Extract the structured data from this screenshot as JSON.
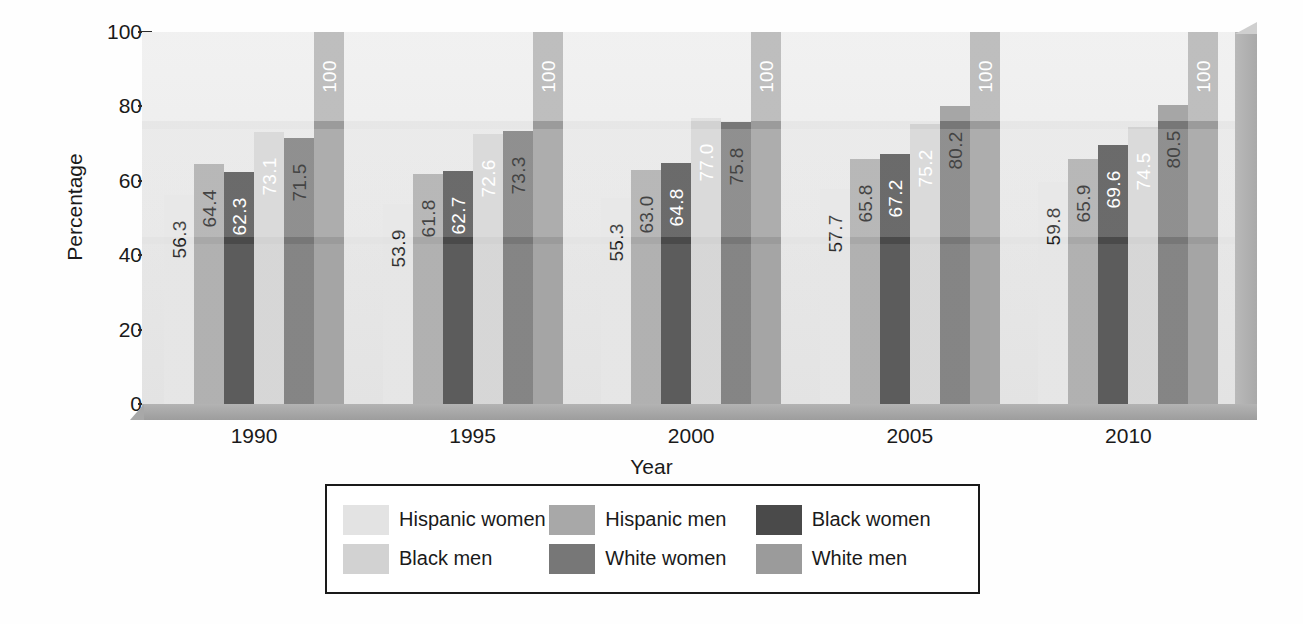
{
  "chart_data": {
    "type": "bar",
    "title": "",
    "xlabel": "Year",
    "ylabel": "Percentage",
    "categories": [
      "1990",
      "1995",
      "2000",
      "2005",
      "2010"
    ],
    "ylim": [
      0,
      100
    ],
    "yticks": [
      "0",
      "20",
      "40",
      "60",
      "80",
      "100"
    ],
    "grid": false,
    "legend_position": "bottom",
    "series": [
      {
        "name": "Hispanic women",
        "color": "#e3e3e3",
        "label_color": "#1a1a1a",
        "values": [
          56.3,
          53.9,
          55.3,
          57.7,
          59.8
        ],
        "labels": [
          "56.3",
          "53.9",
          "55.3",
          "57.7",
          "59.8"
        ]
      },
      {
        "name": "Hispanic men",
        "color": "#a8a8a8",
        "label_color": "#1a1a1a",
        "values": [
          64.4,
          61.8,
          63.0,
          65.8,
          65.9
        ],
        "labels": [
          "64.4",
          "61.8",
          "63.0",
          "65.8",
          "65.9"
        ]
      },
      {
        "name": "Black women",
        "color": "#4a4a4a",
        "label_color": "#ffffff",
        "values": [
          62.3,
          62.7,
          64.8,
          67.2,
          69.6
        ],
        "labels": [
          "62.3",
          "62.7",
          "64.8",
          "67.2",
          "69.6"
        ]
      },
      {
        "name": "Black men",
        "color": "#d2d2d2",
        "label_color": "#ffffff",
        "values": [
          73.1,
          72.6,
          77.0,
          75.2,
          74.5
        ],
        "labels": [
          "73.1",
          "72.6",
          "77.0",
          "75.2",
          "74.5"
        ]
      },
      {
        "name": "White women",
        "color": "#777777",
        "label_color": "#1a1a1a",
        "values": [
          71.5,
          73.3,
          75.8,
          80.2,
          80.5
        ],
        "labels": [
          "71.5",
          "73.3",
          "75.8",
          "80.2",
          "80.5"
        ]
      },
      {
        "name": "White men",
        "color": "#9b9b9b",
        "label_color": "#ffffff",
        "values": [
          100,
          100,
          100,
          100,
          100
        ],
        "labels": [
          "100",
          "100",
          "100",
          "100",
          "100"
        ]
      }
    ]
  },
  "axes": {
    "ylabel": "Percentage",
    "xlabel": "Year",
    "yticks": [
      "100",
      "80",
      "60",
      "40",
      "20",
      "0"
    ],
    "xticks": [
      "1990",
      "1995",
      "2000",
      "2005",
      "2010"
    ]
  },
  "legend": {
    "items": [
      {
        "label": "Hispanic women",
        "color": "#e3e3e3"
      },
      {
        "label": "Hispanic men",
        "color": "#a8a8a8"
      },
      {
        "label": "Black women",
        "color": "#4a4a4a"
      },
      {
        "label": "Black men",
        "color": "#d2d2d2"
      },
      {
        "label": "White women",
        "color": "#777777"
      },
      {
        "label": "White men",
        "color": "#9b9b9b"
      }
    ]
  }
}
